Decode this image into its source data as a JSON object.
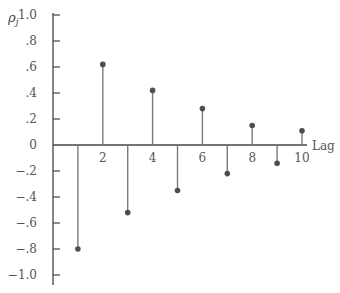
{
  "chart_data": {
    "type": "stem",
    "title": "",
    "xlabel": "Lag",
    "ylabel": "ρj",
    "ylim": [
      -1.0,
      1.0
    ],
    "xlim": [
      0,
      10
    ],
    "grid": false,
    "x": [
      1,
      2,
      3,
      4,
      5,
      6,
      7,
      8,
      9,
      10
    ],
    "values": [
      -0.8,
      0.62,
      -0.52,
      0.42,
      -0.35,
      0.28,
      -0.22,
      0.15,
      -0.14,
      0.11
    ],
    "y_ticks": [
      1.0,
      0.8,
      0.6,
      0.4,
      0.2,
      0,
      -0.2,
      -0.4,
      -0.6,
      -0.8,
      -1.0
    ],
    "y_tick_labels": [
      "1.0",
      ".8",
      ".6",
      ".4",
      ".2",
      "0",
      "−.2",
      "−.4",
      "−.6",
      "−.8",
      "−1.0"
    ],
    "x_ticks": [
      1,
      2,
      3,
      4,
      5,
      6,
      7,
      8,
      9,
      10
    ],
    "x_tick_labels": [
      "2",
      "4",
      "6",
      "8",
      "10"
    ],
    "x_tick_label_positions": [
      2,
      4,
      6,
      8,
      10
    ]
  },
  "colors": {
    "axis": "#444444",
    "stem": "#7a7a7a",
    "marker": "#4d4d4d",
    "text": "#555555"
  }
}
